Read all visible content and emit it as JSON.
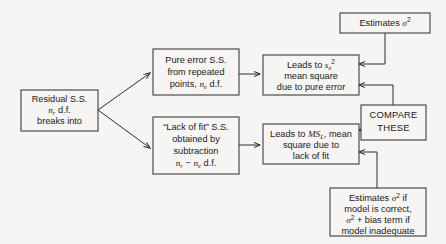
{
  "diagram": {
    "background_color": "#f6f5f3",
    "line_color": "#2b2b2b",
    "text_color": "#1a1a1a",
    "boxes": {
      "residual": {
        "name": "residual-ss-box",
        "lines": [
          "Residual S.S.",
          "n_r d.f.",
          "breaks into"
        ],
        "line1": "Residual S.S.",
        "line2_prefix": "n",
        "line2_sub": "r",
        "line2_suffix": " d.f.",
        "line3": "breaks into"
      },
      "pure_error": {
        "name": "pure-error-ss-box",
        "line1": "Pure error S.S.",
        "line2": "from repeated",
        "line3_prefix": "points, ",
        "line3_var": "n",
        "line3_sub": "e",
        "line3_suffix": " d.f."
      },
      "lack_of_fit": {
        "name": "lack-of-fit-ss-box",
        "line1": "“Lack of fit” S.S.",
        "line2": "obtained by",
        "line3": "subtraction",
        "line4_var1": "n",
        "line4_sub1": "r",
        "line4_minus": " − ",
        "line4_var2": "n",
        "line4_sub2": "e",
        "line4_suffix": " d.f."
      },
      "pure_error_ms": {
        "name": "pure-error-mean-square-box",
        "line1_prefix": "Leads to ",
        "line1_var": "s",
        "line1_sub": "e",
        "line1_sup": "2",
        "line2": "mean square",
        "line3": "due to pure error"
      },
      "lack_of_fit_ms": {
        "name": "lack-of-fit-mean-square-box",
        "line1_prefix": "Leads to ",
        "line1_var": "MS",
        "line1_sub": "L",
        "line1_suffix": ", mean",
        "line2": "square due to",
        "line3": "lack of fit"
      },
      "estimates_sigma": {
        "name": "estimates-sigma-squared-box",
        "text_prefix": "Estimates ",
        "sigma": "σ",
        "sup": "2"
      },
      "compare": {
        "name": "compare-these-box",
        "line1": "COMPARE",
        "line2": "THESE"
      },
      "estimates_bias": {
        "name": "estimates-sigma-bias-box",
        "line1_prefix": "Estimates ",
        "line1_sigma": "σ",
        "line1_sup": "2",
        "line1_suffix": " if",
        "line2": "model is correct,",
        "line3_sigma": "σ",
        "line3_sup": "2",
        "line3_suffix": " + bias term if",
        "line4": "model inadequate"
      }
    },
    "edges": [
      {
        "name": "edge-residual-to-pure-error",
        "from": "residual",
        "to": "pure_error",
        "arrow": true
      },
      {
        "name": "edge-residual-to-lack-of-fit",
        "from": "residual",
        "to": "lack_of_fit",
        "arrow": true
      },
      {
        "name": "edge-pure-error-to-mean-square",
        "from": "pure_error",
        "to": "pure_error_ms",
        "arrow": true
      },
      {
        "name": "edge-lack-of-fit-to-mean-square",
        "from": "lack_of_fit",
        "to": "lack_of_fit_ms",
        "arrow": true
      },
      {
        "name": "edge-estimates-sigma-to-pure-error-ms",
        "from": "estimates_sigma",
        "to": "pure_error_ms",
        "arrow": true
      },
      {
        "name": "edge-compare-to-pure-error-ms",
        "from": "compare",
        "to": "pure_error_ms",
        "arrow": true
      },
      {
        "name": "edge-compare-to-lack-of-fit-ms",
        "from": "compare",
        "to": "lack_of_fit_ms",
        "arrow": true
      },
      {
        "name": "edge-estimates-bias-to-lack-of-fit-ms",
        "from": "estimates_bias",
        "to": "lack_of_fit_ms",
        "arrow": true
      }
    ]
  }
}
